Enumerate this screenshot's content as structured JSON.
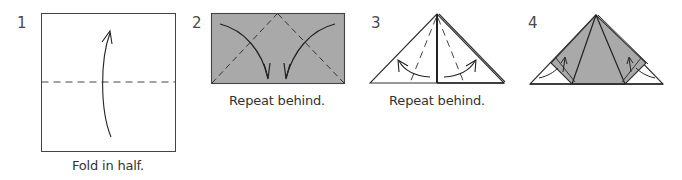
{
  "diagram": {
    "type": "origami-instructions",
    "colors": {
      "paper_white": "#ffffff",
      "paper_colored": "#a9a9a9",
      "line": "#333333",
      "text": "#333333"
    },
    "steps": [
      {
        "number": "1",
        "caption": "Fold in half.",
        "figure": "square-with-horizontal-valley-fold-and-up-arrow"
      },
      {
        "number": "2",
        "caption": "Repeat behind.",
        "figure": "rectangle-with-diagonal-folds-and-down-arrows"
      },
      {
        "number": "3",
        "caption": "Repeat behind.",
        "figure": "triangle-with-flap-folds-and-curved-arrows"
      },
      {
        "number": "4",
        "caption": "",
        "figure": "triangle-with-inside-reverse-folds"
      }
    ]
  }
}
